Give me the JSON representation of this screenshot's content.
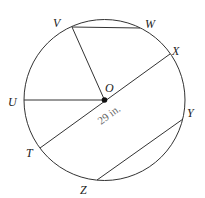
{
  "diagram": {
    "circle": {
      "cx": 104.5,
      "cy": 100,
      "r": 80.5
    },
    "center": {
      "label": "O",
      "x": 104.5,
      "y": 100
    },
    "points": [
      {
        "id": "V",
        "label": "V",
        "x": 72,
        "y": 27
      },
      {
        "id": "W",
        "label": "W",
        "x": 140,
        "y": 28
      },
      {
        "id": "X",
        "label": "X",
        "x": 170,
        "y": 54
      },
      {
        "id": "U",
        "label": "U",
        "x": 24,
        "y": 100
      },
      {
        "id": "T",
        "label": "T",
        "x": 40,
        "y": 148
      },
      {
        "id": "Y",
        "label": "Y",
        "x": 183,
        "y": 119
      },
      {
        "id": "Z",
        "label": "Z",
        "x": 97,
        "y": 180
      }
    ],
    "segments": [
      {
        "name": "chord-VW",
        "from": "V",
        "to": "W"
      },
      {
        "name": "radius-OV",
        "from": "O",
        "to": "V"
      },
      {
        "name": "radius-OU",
        "from": "O",
        "to": "U"
      },
      {
        "name": "diameter-TX",
        "from": "T",
        "to": "X"
      },
      {
        "name": "chord-ZY",
        "from": "Z",
        "to": "Y"
      }
    ],
    "measurement": {
      "text": "29 in.",
      "segment": "diameter-TX"
    }
  }
}
